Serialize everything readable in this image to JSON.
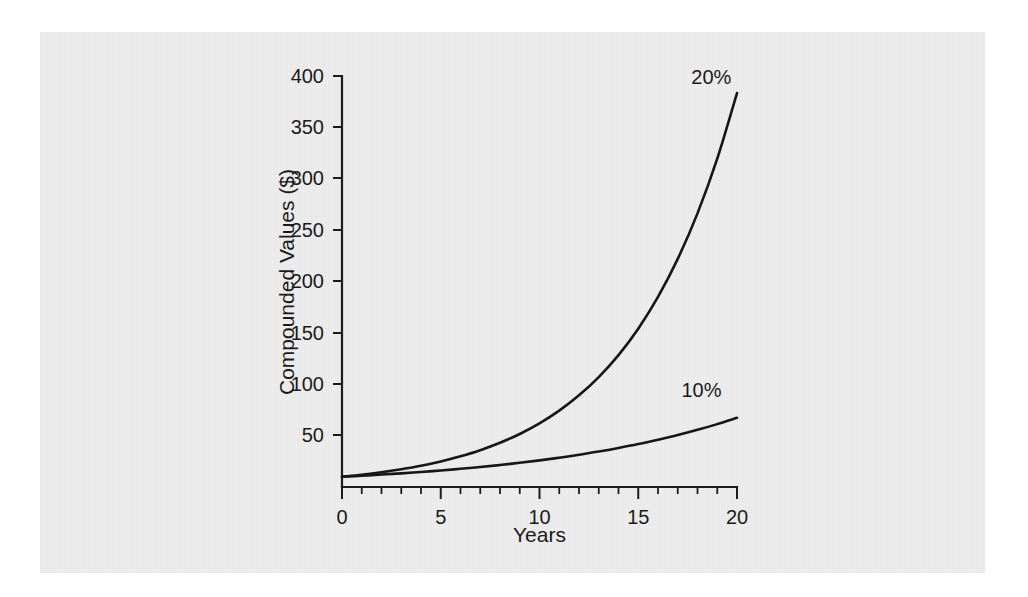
{
  "figure": {
    "background_color": "#ffffff",
    "plate_color": "#ededed",
    "ink_color": "#161616"
  },
  "chart_data": {
    "type": "line",
    "title": "",
    "subtitle": "",
    "xlabel": "Years",
    "ylabel": "Compounded Values ($)",
    "xlim": [
      0,
      20
    ],
    "ylim": [
      0,
      400
    ],
    "xticks": [
      0,
      5,
      10,
      15,
      20
    ],
    "xtick_labels": [
      "0",
      "5",
      "10",
      "15",
      "20"
    ],
    "x_minor_tick_interval": 1,
    "yticks": [
      50,
      100,
      150,
      200,
      250,
      300,
      350,
      400
    ],
    "ytick_labels": [
      "50",
      "100",
      "150",
      "200",
      "250",
      "300",
      "350",
      "400"
    ],
    "grid": false,
    "legend_position": "inline-annotation",
    "x": [
      0,
      1,
      2,
      3,
      4,
      5,
      6,
      7,
      8,
      9,
      10,
      11,
      12,
      13,
      14,
      15,
      16,
      17,
      18,
      19,
      20
    ],
    "series": [
      {
        "name": "20%",
        "label": "20%",
        "label_x": 18.7,
        "label_y": 392,
        "color": "#161616",
        "values": [
          10,
          12,
          14.4,
          17.3,
          20.7,
          24.9,
          29.9,
          35.8,
          43,
          51.6,
          61.9,
          74.3,
          89.2,
          107,
          128.4,
          154.1,
          185,
          222,
          266.3,
          319.5,
          383.4
        ]
      },
      {
        "name": "10%",
        "label": "10%",
        "label_x": 18.2,
        "label_y": 88,
        "color": "#161616",
        "values": [
          10,
          11,
          12.1,
          13.3,
          14.6,
          16.1,
          17.7,
          19.5,
          21.4,
          23.6,
          25.9,
          28.5,
          31.4,
          34.5,
          38,
          41.8,
          46,
          50.5,
          55.6,
          61.2,
          67.3
        ]
      }
    ]
  }
}
